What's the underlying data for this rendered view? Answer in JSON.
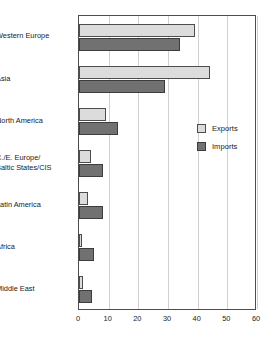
{
  "chart_data": {
    "type": "bar",
    "orientation": "horizontal",
    "title": "",
    "subtitle": "",
    "xlabel": "",
    "ylabel": "",
    "xlim": [
      0,
      60
    ],
    "xticks": [
      0,
      10,
      20,
      30,
      40,
      50,
      60
    ],
    "xtick_labels": [
      "0",
      "10",
      "20",
      "30",
      "40",
      "50",
      "60"
    ],
    "grid": true,
    "grid_axis": "x",
    "legend_position": "right-middle",
    "categories": [
      "Western Europe",
      "Asia",
      "North America",
      "C./E. Europe/\nBaltic States/CIS",
      "Latin America",
      "Africa",
      "Middle East"
    ],
    "series": [
      {
        "name": "Exports",
        "color": "#dcdcdc",
        "values": [
          39,
          44,
          9,
          4,
          3,
          1,
          1.5
        ]
      },
      {
        "name": "Imports",
        "color": "#717171",
        "values": [
          34,
          29,
          13,
          8,
          8,
          5,
          4.5
        ]
      }
    ]
  },
  "legend": {
    "items": [
      {
        "label": "Exports",
        "color": "#dcdcdc"
      },
      {
        "label": "Imports",
        "color": "#717171"
      }
    ]
  },
  "colors": {
    "exports": "#dcdcdc",
    "imports": "#717171",
    "frame": "#4d4d4d",
    "grid": "#d0d0d0",
    "background": "#ffffff",
    "text": "#1a1a1a"
  }
}
